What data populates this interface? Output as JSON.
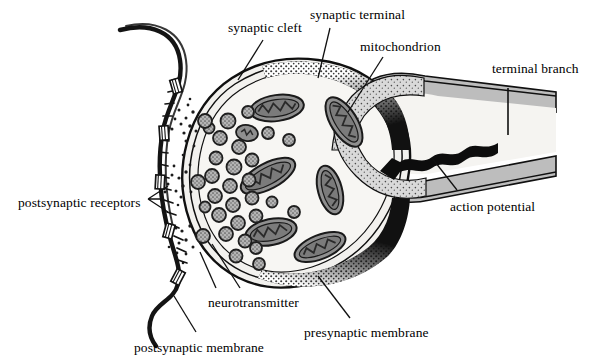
{
  "figure": {
    "type": "biological-diagram"
  },
  "colors": {
    "ink": "#101010",
    "membrane_dark": "#1a1a1a",
    "cytoplasm": "#f2f1ee",
    "organelle_fill": "#8f8f8f",
    "axon_fill": "#bdbdbd",
    "vesicle_fill": "#b9b9b9",
    "stipple": "#6e6e6e",
    "background": "#ffffff"
  },
  "labels": [
    {
      "id": "synaptic-cleft",
      "text": "synaptic cleft",
      "x": 228,
      "y": 21
    },
    {
      "id": "synaptic-terminal",
      "text": "synaptic terminal",
      "x": 310,
      "y": 8
    },
    {
      "id": "mitochondrion",
      "text": "mitochondrion",
      "x": 360,
      "y": 40
    },
    {
      "id": "terminal-branch",
      "text": "terminal branch",
      "x": 492,
      "y": 62
    },
    {
      "id": "action-potential",
      "text": "action potential",
      "x": 450,
      "y": 200
    },
    {
      "id": "postsynaptic-receptors",
      "text": "postsynaptic receptors",
      "x": 18,
      "y": 196
    },
    {
      "id": "neurotransmitter",
      "text": "neurotransmitter",
      "x": 208,
      "y": 296
    },
    {
      "id": "presynaptic-membrane",
      "text": "presynaptic membrane",
      "x": 304,
      "y": 326
    },
    {
      "id": "postsynaptic-membrane",
      "text": "postsynaptic membrane",
      "x": 134,
      "y": 341
    }
  ],
  "structures": {
    "synaptic_terminal": "bulb-shaped presynaptic ending filled with cytoplasm",
    "vesicle_count": 27,
    "mitochondria_count": 7,
    "fusion_sites": 3,
    "receptor_count": 5,
    "arrow_direction": "leftward along terminal branch toward the bulb"
  }
}
